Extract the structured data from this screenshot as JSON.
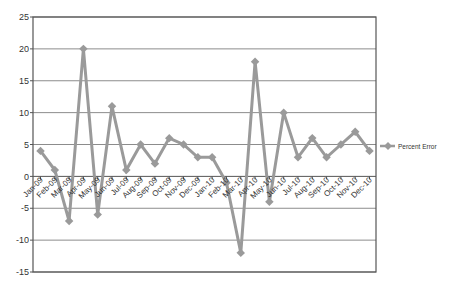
{
  "chart_data": {
    "type": "line",
    "title": "",
    "xlabel": "",
    "ylabel": "",
    "ylim": [
      -15,
      25
    ],
    "yticks": [
      25,
      20,
      15,
      10,
      5,
      0,
      -5,
      -10,
      -15
    ],
    "grid": true,
    "legend_position": "right",
    "categories": [
      "Jan-09",
      "Feb-09",
      "Mar-09",
      "Apr-09",
      "May-09",
      "Jun-09",
      "Jul-09",
      "Aug-09",
      "Sep-09",
      "Oct-09",
      "Nov-09",
      "Dec-09",
      "Jan-10",
      "Feb-10",
      "Mar-10",
      "Apr-10",
      "May-10",
      "Jun-10",
      "Jul-10",
      "Aug-10",
      "Sep-10",
      "Oct-10",
      "Nov-10",
      "Dec-10"
    ],
    "series": [
      {
        "name": "Percent Error",
        "color": "#9a9a9a",
        "values": [
          4,
          1,
          -7,
          20,
          -6,
          11,
          1,
          5,
          2,
          6,
          5,
          3,
          3,
          -1,
          -12,
          18,
          -4,
          10,
          3,
          6,
          3,
          5,
          7,
          4
        ]
      }
    ]
  },
  "colors": {
    "gridline": "#8c8c8c",
    "axis": "#555555",
    "series": "#9a9a9a"
  },
  "legend": {
    "label": "Percent Error"
  }
}
